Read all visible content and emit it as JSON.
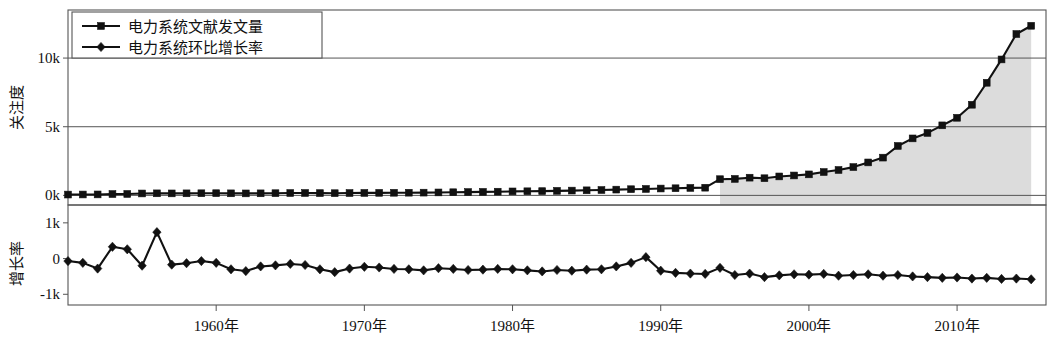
{
  "chart_data": {
    "type": "line",
    "title": "",
    "xlabel": "",
    "panels": [
      {
        "name": "attention-panel",
        "ylabel": "关注度",
        "ytick_labels": [
          "10k",
          "5k",
          "0k"
        ],
        "ytick_values": [
          10000,
          5000,
          0
        ],
        "ylim": [
          -700,
          13500
        ],
        "grid": true,
        "series_name": "电力系统文献发文量"
      },
      {
        "name": "growth-panel",
        "ylabel": "增长率",
        "ytick_labels": [
          "1k",
          "0",
          "-1k"
        ],
        "ytick_values": [
          1000,
          0,
          -1000
        ],
        "ylim": [
          -1300,
          1500
        ],
        "grid": false,
        "series_name": "电力系统环比增长率"
      }
    ],
    "xlim": [
      1950,
      2016
    ],
    "xtick_labels": [
      "1960年",
      "1970年",
      "1980年",
      "1990年",
      "2000年",
      "2010年"
    ],
    "xtick_values": [
      1960,
      1970,
      1980,
      1990,
      2000,
      2010
    ],
    "legend": {
      "position": "top-left",
      "entries": [
        {
          "label": "电力系统文献发文量",
          "marker": "square"
        },
        {
          "label": "电力系统环比增长率",
          "marker": "diamond"
        }
      ]
    },
    "x": [
      1950,
      1951,
      1952,
      1953,
      1954,
      1955,
      1956,
      1957,
      1958,
      1959,
      1960,
      1961,
      1962,
      1963,
      1964,
      1965,
      1966,
      1967,
      1968,
      1969,
      1970,
      1971,
      1972,
      1973,
      1974,
      1975,
      1976,
      1977,
      1978,
      1979,
      1980,
      1981,
      1982,
      1983,
      1984,
      1985,
      1986,
      1987,
      1988,
      1989,
      1990,
      1991,
      1992,
      1993,
      1994,
      1995,
      1996,
      1997,
      1998,
      1999,
      2000,
      2001,
      2002,
      2003,
      2004,
      2005,
      2006,
      2007,
      2008,
      2009,
      2010,
      2011,
      2012,
      2013,
      2014,
      2015
    ],
    "series": [
      {
        "name": "电力系统文献发文量",
        "marker": "square",
        "panel": "attention-panel",
        "values": [
          60,
          65,
          70,
          95,
          105,
          140,
          150,
          145,
          150,
          155,
          160,
          150,
          145,
          150,
          160,
          170,
          175,
          165,
          160,
          170,
          180,
          185,
          190,
          195,
          200,
          215,
          230,
          240,
          255,
          270,
          290,
          300,
          310,
          330,
          350,
          370,
          390,
          420,
          450,
          470,
          500,
          520,
          545,
          560,
          1180,
          1200,
          1290,
          1250,
          1380,
          1450,
          1530,
          1700,
          1850,
          2060,
          2400,
          2750,
          3600,
          4150,
          4550,
          5100,
          5650,
          6600,
          8200,
          9900,
          11750,
          12350
        ]
      },
      {
        "name": "电力系统环比增长率",
        "marker": "diamond",
        "panel": "growth-panel",
        "values": [
          -70,
          -120,
          -280,
          330,
          260,
          -200,
          740,
          -170,
          -130,
          -70,
          -120,
          -300,
          -350,
          -220,
          -190,
          -150,
          -180,
          -300,
          -380,
          -280,
          -230,
          -250,
          -290,
          -300,
          -330,
          -270,
          -290,
          -320,
          -310,
          -290,
          -300,
          -330,
          -360,
          -320,
          -340,
          -310,
          -300,
          -220,
          -120,
          40,
          -340,
          -400,
          -420,
          -430,
          -260,
          -460,
          -420,
          -520,
          -470,
          -440,
          -450,
          -430,
          -480,
          -460,
          -440,
          -480,
          -460,
          -500,
          -520,
          -540,
          -530,
          -560,
          -540,
          -570,
          -560,
          -580
        ]
      }
    ],
    "shaded_region": {
      "from": 1994,
      "to": 2015,
      "color": "#dcdcdc",
      "panel": "attention-panel"
    }
  }
}
